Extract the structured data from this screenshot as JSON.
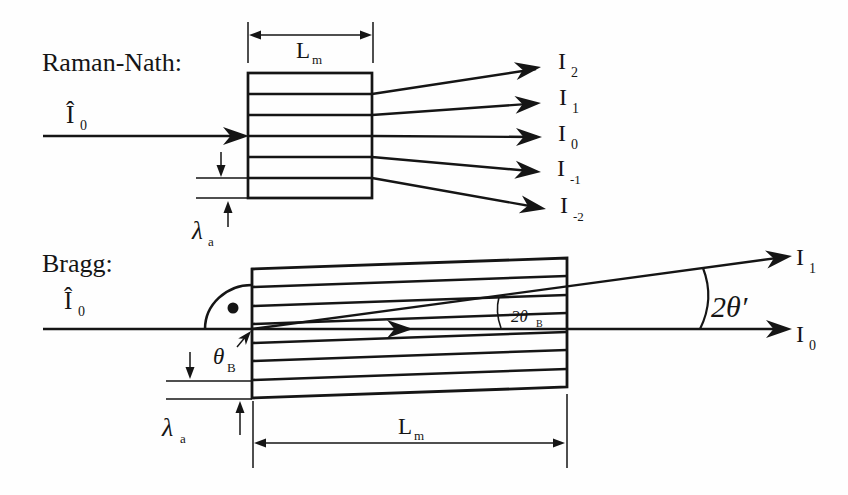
{
  "figure": {
    "background_color": "#fefefe",
    "ink_color": "#151515",
    "raman_nath": {
      "title": "Raman-Nath:",
      "incident_label": {
        "base": "Î",
        "sub": "0"
      },
      "width_label": {
        "base": "L",
        "sub": "m"
      },
      "wavelength_label": {
        "base": "λ",
        "sub": "a"
      },
      "orders": [
        {
          "base": "I",
          "sub": "2"
        },
        {
          "base": "I",
          "sub": "1"
        },
        {
          "base": "I",
          "sub": "0"
        },
        {
          "base": "I",
          "sub": "-1"
        },
        {
          "base": "I",
          "sub": "-2"
        }
      ]
    },
    "bragg": {
      "title": "Bragg:",
      "incident_label": {
        "base": "Î",
        "sub": "0"
      },
      "width_label": {
        "base": "L",
        "sub": "m"
      },
      "wavelength_label": {
        "base": "λ",
        "sub": "a"
      },
      "bragg_angle_label": {
        "base": "θ",
        "sub": "B"
      },
      "internal_angle_label": {
        "base": "2θ",
        "sub": "B"
      },
      "external_angle_label": "2θ′",
      "orders": [
        {
          "base": "I",
          "sub": "1"
        },
        {
          "base": "I",
          "sub": "0"
        }
      ]
    }
  }
}
